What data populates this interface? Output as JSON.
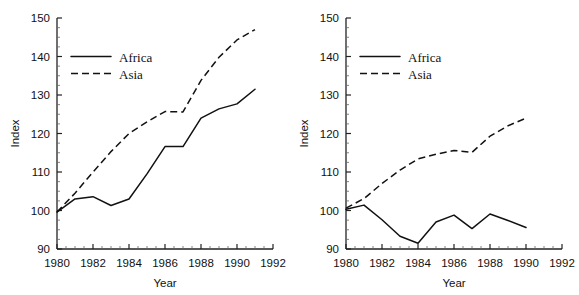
{
  "figure": {
    "background": "#ffffff",
    "line_color": "#111111"
  },
  "chart_data": [
    {
      "type": "line",
      "title": "",
      "xlabel": "Year",
      "ylabel": "Index",
      "xlim": [
        1980,
        1992
      ],
      "ylim": [
        90,
        150
      ],
      "xticks": [
        1980,
        1982,
        1984,
        1986,
        1988,
        1990,
        1992
      ],
      "xticklabels": [
        "1980",
        "1982",
        "1984",
        "1986",
        "1988",
        "1990",
        "1992"
      ],
      "yticks": [
        90,
        100,
        110,
        120,
        130,
        140,
        150
      ],
      "yticklabels": [
        "90",
        "100",
        "110",
        "120",
        "130",
        "140",
        "150"
      ],
      "grid": false,
      "legend_position": "upper-left",
      "x": [
        1980,
        1981,
        1982,
        1983,
        1984,
        1985,
        1986,
        1987,
        1988,
        1989,
        1990,
        1991
      ],
      "series": [
        {
          "name": "Africa",
          "style": "solid",
          "values": [
            99.6,
            103.0,
            103.6,
            101.3,
            103.0,
            109.5,
            116.6,
            116.6,
            124.0,
            126.4,
            127.7,
            131.5
          ]
        },
        {
          "name": "Asia",
          "style": "dashed",
          "values": [
            99.6,
            104.5,
            110.0,
            115.3,
            120.0,
            123.0,
            125.7,
            125.6,
            133.8,
            139.8,
            144.3,
            147.0
          ]
        }
      ]
    },
    {
      "type": "line",
      "title": "",
      "xlabel": "Year",
      "ylabel": "Index",
      "xlim": [
        1980,
        1992
      ],
      "ylim": [
        90,
        150
      ],
      "xticks": [
        1980,
        1982,
        1984,
        1986,
        1988,
        1990,
        1992
      ],
      "xticklabels": [
        "1980",
        "1982",
        "1984",
        "1986",
        "1988",
        "1990",
        "1992"
      ],
      "yticks": [
        90,
        100,
        110,
        120,
        130,
        140,
        150
      ],
      "yticklabels": [
        "90",
        "100",
        "110",
        "120",
        "130",
        "140",
        "150"
      ],
      "grid": false,
      "legend_position": "upper-left",
      "x": [
        1980,
        1981,
        1982,
        1983,
        1984,
        1985,
        1986,
        1987,
        1988,
        1989,
        1990
      ],
      "series": [
        {
          "name": "Africa",
          "style": "solid",
          "values": [
            100.3,
            101.4,
            97.6,
            93.3,
            91.5,
            97.0,
            98.8,
            95.3,
            99.1,
            97.4,
            95.6
          ]
        },
        {
          "name": "Asia",
          "style": "dashed",
          "values": [
            100.6,
            103.1,
            107.0,
            110.5,
            113.4,
            114.6,
            115.6,
            115.1,
            119.3,
            122.0,
            124.0
          ]
        }
      ]
    }
  ],
  "panels": [
    {
      "id": "left",
      "legend": [
        {
          "label": "Africa",
          "style": "solid"
        },
        {
          "label": "Asia",
          "style": "dashed"
        }
      ]
    },
    {
      "id": "right",
      "legend": [
        {
          "label": "Africa",
          "style": "solid"
        },
        {
          "label": "Asia",
          "style": "dashed"
        }
      ]
    }
  ]
}
